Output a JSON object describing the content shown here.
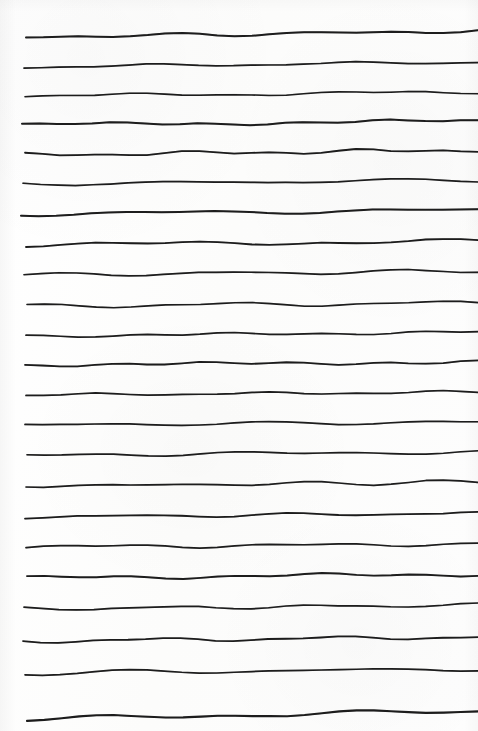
{
  "document": {
    "kind": "scanned-lined-paper",
    "title": "Ruled notebook page",
    "orientation": "portrait",
    "page_width": 478,
    "page_height": 731,
    "background_color": "#fdfdfc",
    "ink_color": "#1d1d1d",
    "written_text": "",
    "line_count": 23,
    "left_margin_x": 24,
    "right_edge_x": 478,
    "nominal_line_spacing": 30
  },
  "rules": [
    {
      "index": 1,
      "y_left": 37,
      "y_right": 31,
      "thickness": 2.0,
      "x_start": 26,
      "x_end": 478
    },
    {
      "index": 2,
      "y_left": 67,
      "y_right": 62,
      "thickness": 1.7,
      "x_start": 24,
      "x_end": 478
    },
    {
      "index": 3,
      "y_left": 96,
      "y_right": 92,
      "thickness": 1.6,
      "x_start": 25,
      "x_end": 478
    },
    {
      "index": 4,
      "y_left": 125,
      "y_right": 121,
      "thickness": 2.0,
      "x_start": 22,
      "x_end": 478
    },
    {
      "index": 5,
      "y_left": 155,
      "y_right": 150,
      "thickness": 1.8,
      "x_start": 25,
      "x_end": 478
    },
    {
      "index": 6,
      "y_left": 184,
      "y_right": 180,
      "thickness": 1.7,
      "x_start": 23,
      "x_end": 478
    },
    {
      "index": 7,
      "y_left": 214,
      "y_right": 210,
      "thickness": 2.0,
      "x_start": 21,
      "x_end": 478
    },
    {
      "index": 8,
      "y_left": 245,
      "y_right": 241,
      "thickness": 1.8,
      "x_start": 26,
      "x_end": 478
    },
    {
      "index": 9,
      "y_left": 275,
      "y_right": 271,
      "thickness": 1.7,
      "x_start": 24,
      "x_end": 478
    },
    {
      "index": 10,
      "y_left": 306,
      "y_right": 303,
      "thickness": 1.6,
      "x_start": 27,
      "x_end": 478
    },
    {
      "index": 11,
      "y_left": 336,
      "y_right": 332,
      "thickness": 1.7,
      "x_start": 26,
      "x_end": 478
    },
    {
      "index": 12,
      "y_left": 365,
      "y_right": 362,
      "thickness": 1.8,
      "x_start": 25,
      "x_end": 478
    },
    {
      "index": 13,
      "y_left": 395,
      "y_right": 392,
      "thickness": 1.7,
      "x_start": 26,
      "x_end": 478
    },
    {
      "index": 14,
      "y_left": 425,
      "y_right": 422,
      "thickness": 1.7,
      "x_start": 25,
      "x_end": 478
    },
    {
      "index": 15,
      "y_left": 455,
      "y_right": 452,
      "thickness": 1.7,
      "x_start": 27,
      "x_end": 478
    },
    {
      "index": 16,
      "y_left": 486,
      "y_right": 482,
      "thickness": 1.7,
      "x_start": 26,
      "x_end": 478
    },
    {
      "index": 17,
      "y_left": 517,
      "y_right": 513,
      "thickness": 1.8,
      "x_start": 25,
      "x_end": 478
    },
    {
      "index": 18,
      "y_left": 547,
      "y_right": 544,
      "thickness": 1.7,
      "x_start": 26,
      "x_end": 478
    },
    {
      "index": 19,
      "y_left": 578,
      "y_right": 574,
      "thickness": 1.9,
      "x_start": 27,
      "x_end": 478
    },
    {
      "index": 20,
      "y_left": 609,
      "y_right": 605,
      "thickness": 1.7,
      "x_start": 24,
      "x_end": 478
    },
    {
      "index": 21,
      "y_left": 641,
      "y_right": 637,
      "thickness": 1.8,
      "x_start": 23,
      "x_end": 478
    },
    {
      "index": 22,
      "y_left": 673,
      "y_right": 669,
      "thickness": 1.7,
      "x_start": 25,
      "x_end": 478
    },
    {
      "index": 23,
      "y_left": 719,
      "y_right": 711,
      "thickness": 2.1,
      "x_start": 27,
      "x_end": 478
    }
  ]
}
